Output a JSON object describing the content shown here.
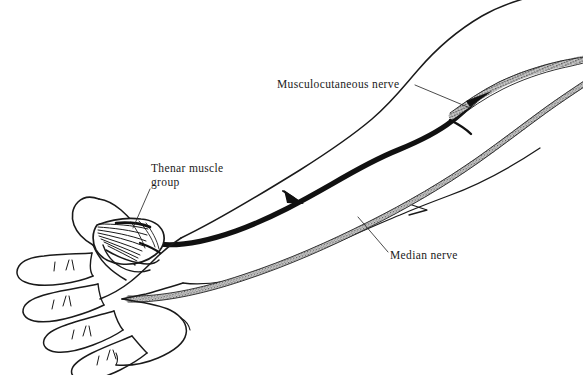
{
  "figure": {
    "kind": "anatomical-line-drawing",
    "background_color": "#ffffff",
    "ink_color": "#1a1a1a",
    "width": 583,
    "height": 375
  },
  "labels": {
    "musculocutaneous": {
      "text": "Musculocutaneous nerve",
      "x": 277,
      "y": 78
    },
    "thenar": {
      "line1": "Thenar muscle",
      "line2": "group",
      "x": 151,
      "y": 162
    },
    "median": {
      "text": "Median nerve",
      "x": 390,
      "y": 249
    }
  },
  "structures": [
    {
      "name": "median-nerve",
      "style": "solid-black-cord",
      "color": "#111111",
      "description": "Thick solid black nerve trunk running from upper arm to thenar muscle group"
    },
    {
      "name": "musculocutaneous-nerve",
      "style": "stippled-cord",
      "color": "#3a3a3a",
      "description": "Stippled nerve band in the upper arm, superior to median nerve"
    },
    {
      "name": "stippled-forearm-nerve",
      "style": "stippled-cord",
      "color": "#3a3a3a",
      "description": "Second stippled band running along the ulnar border of the forearm"
    },
    {
      "name": "thenar-muscle-group",
      "style": "striated-fan",
      "color": "#1a1a1a",
      "description": "Fan-shaped striated muscle belly at the base of the thumb"
    },
    {
      "name": "hand-and-arm-outline",
      "style": "pen-contour",
      "color": "#1a1a1a",
      "description": "Outline of hand with four fingers, thumb, wrist, forearm and arm"
    }
  ]
}
